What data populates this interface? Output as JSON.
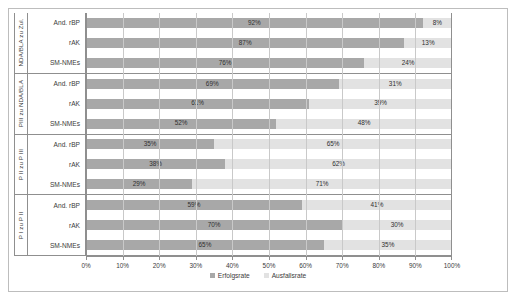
{
  "chart_data": {
    "type": "bar",
    "subtype": "stacked-horizontal-100",
    "title": "",
    "xlabel": "",
    "ylabel": "",
    "xlim": [
      0,
      100
    ],
    "xticks": [
      "0%",
      "10%",
      "20%",
      "30%",
      "40%",
      "50%",
      "60%",
      "70%",
      "80%",
      "90%",
      "100%"
    ],
    "grid": true,
    "legend_position": "bottom",
    "series": [
      {
        "name": "Erfolgsrate",
        "color": "#a8a8a8"
      },
      {
        "name": "Ausfallsrate",
        "color": "#e2e2e2"
      }
    ],
    "groups": [
      {
        "label": "NDA/BLA zu Zul.",
        "rows": [
          {
            "category": "And. rBP",
            "success": 92,
            "fail": 8,
            "success_label": "92%",
            "fail_label": "8%"
          },
          {
            "category": "rAK",
            "success": 87,
            "fail": 13,
            "success_label": "87%",
            "fail_label": "13%"
          },
          {
            "category": "SM-NMEs",
            "success": 76,
            "fail": 24,
            "success_label": "76%",
            "fail_label": "24%"
          }
        ]
      },
      {
        "label": "PIII zu NDA/BLA",
        "rows": [
          {
            "category": "And. rBP",
            "success": 69,
            "fail": 31,
            "success_label": "69%",
            "fail_label": "31%"
          },
          {
            "category": "rAK",
            "success": 61,
            "fail": 39,
            "success_label": "61%",
            "fail_label": "39%"
          },
          {
            "category": "SM-NMEs",
            "success": 52,
            "fail": 48,
            "success_label": "52%",
            "fail_label": "48%"
          }
        ]
      },
      {
        "label": "P II zu P III",
        "rows": [
          {
            "category": "And. rBP",
            "success": 35,
            "fail": 65,
            "success_label": "35%",
            "fail_label": "65%"
          },
          {
            "category": "rAK",
            "success": 38,
            "fail": 62,
            "success_label": "38%",
            "fail_label": "62%"
          },
          {
            "category": "SM-NMEs",
            "success": 29,
            "fail": 71,
            "success_label": "29%",
            "fail_label": "71%"
          }
        ]
      },
      {
        "label": "P I zu P II",
        "rows": [
          {
            "category": "And. rBP",
            "success": 59,
            "fail": 41,
            "success_label": "59%",
            "fail_label": "41%"
          },
          {
            "category": "rAK",
            "success": 70,
            "fail": 30,
            "success_label": "70%",
            "fail_label": "30%"
          },
          {
            "category": "SM-NMEs",
            "success": 65,
            "fail": 35,
            "success_label": "65%",
            "fail_label": "35%"
          }
        ]
      }
    ]
  }
}
